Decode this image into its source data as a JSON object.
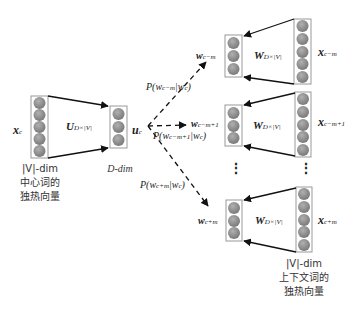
{
  "diagram": {
    "colors": {
      "node_fill": "#8a8a8a",
      "box_stroke": "#999999",
      "arrow": "#111111"
    },
    "input": {
      "label": "x",
      "label_sub": "c",
      "caption_line1": "|V|-dim",
      "caption_line2": "中心词的",
      "caption_line3": "独热向量",
      "nodes": 5
    },
    "projection": {
      "matrix": "U",
      "matrix_sub": "D×|V|"
    },
    "hidden": {
      "label": "u",
      "label_sub": "c",
      "caption": "D-dim",
      "nodes": 3
    },
    "outputs": [
      {
        "word": "w",
        "word_sub": "c−m",
        "prob": "P(w",
        "prob_sub1": "c−m",
        "prob_mid": "|w",
        "prob_sub2": "c",
        "prob_end": ")",
        "matrix": "W",
        "matrix_sub": "D×|V|",
        "context": "x",
        "context_sub": "c−m"
      },
      {
        "word": "w",
        "word_sub": "c−m+1",
        "prob": "P(w",
        "prob_sub1": "c−m+1",
        "prob_mid": "|w",
        "prob_sub2": "c",
        "prob_end": ")",
        "matrix": "W",
        "matrix_sub": "D×|V|",
        "context": "x",
        "context_sub": "c−m+1"
      },
      {
        "word": "w",
        "word_sub": "c+m",
        "prob": "P(w",
        "prob_sub1": "c+m",
        "prob_mid": "|w",
        "prob_sub2": "c",
        "prob_end": ")",
        "matrix": "W",
        "matrix_sub": "D×|V|",
        "context": "x",
        "context_sub": "c+m"
      }
    ],
    "ellipsis": "⋮",
    "context_caption": {
      "line1": "|V|-dim",
      "line2": "上下文词的",
      "line3": "独热向量"
    }
  }
}
